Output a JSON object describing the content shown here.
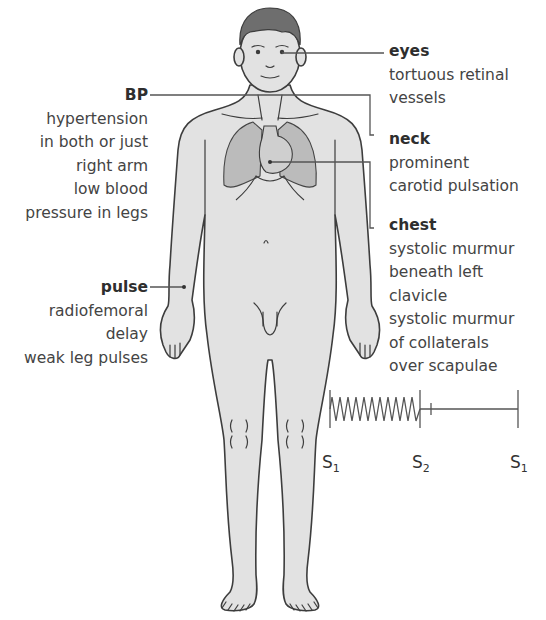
{
  "colors": {
    "skin": "#e2e2e2",
    "outline": "#3d3d3d",
    "hair": "#6e6e6e",
    "lungs": "#b9b9b9",
    "leader_line": "#555555",
    "text": "#444444"
  },
  "annotations": {
    "bp": {
      "title": "BP",
      "lines": [
        "hypertension",
        "in both or just",
        "right arm",
        "low blood",
        "pressure in legs"
      ]
    },
    "pulse": {
      "title": "pulse",
      "lines": [
        "radiofemoral",
        "delay",
        "weak leg pulses"
      ]
    },
    "eyes": {
      "title": "eyes",
      "lines": [
        "tortuous retinal",
        "vessels"
      ]
    },
    "neck": {
      "title": "neck",
      "lines": [
        "prominent",
        "carotid pulsation"
      ]
    },
    "chest": {
      "title": "chest",
      "lines": [
        "systolic murmur",
        "beneath left",
        "clavicle",
        "systolic murmur",
        "of collaterals",
        "over scapulae"
      ]
    }
  },
  "phonocardiogram": {
    "labels": [
      {
        "base": "S",
        "sub": "1"
      },
      {
        "base": "S",
        "sub": "2"
      },
      {
        "base": "S",
        "sub": "1"
      }
    ]
  }
}
